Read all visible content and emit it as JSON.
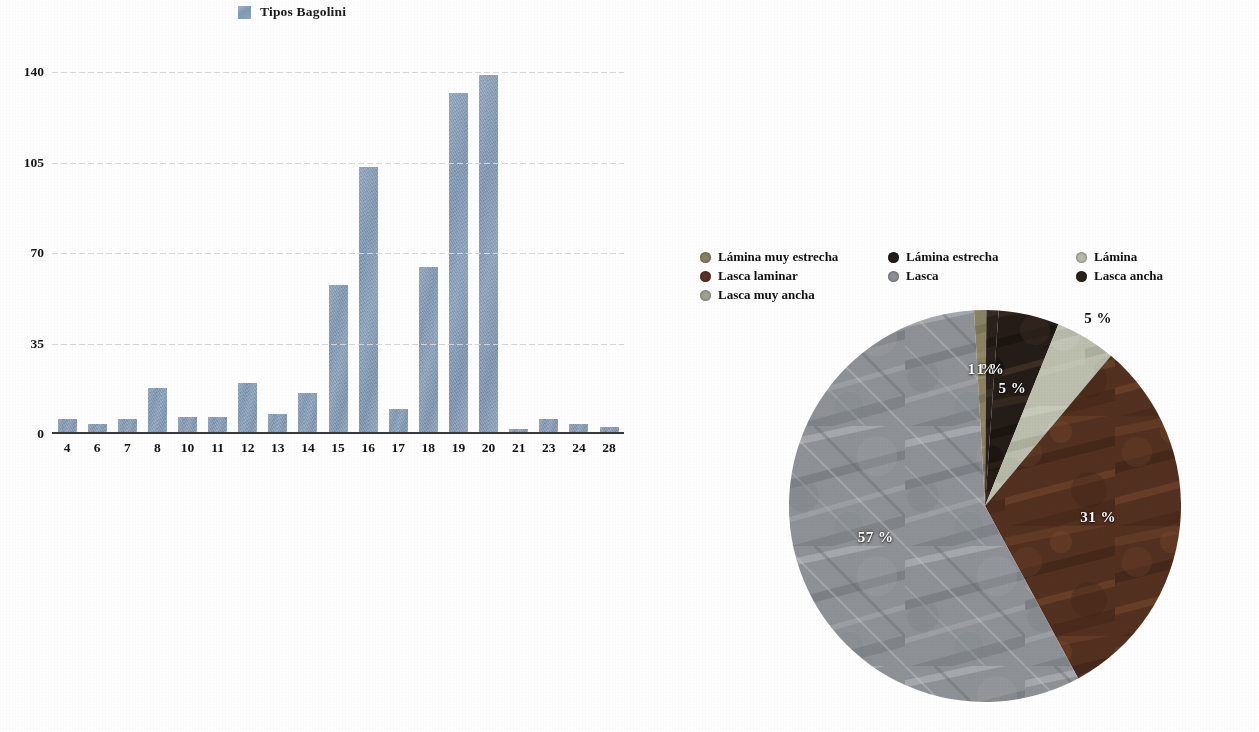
{
  "bar_legend": {
    "label": "Tipos Bagolini",
    "swatch_color": "#7f9ab5"
  },
  "pie_legend": {
    "items": [
      {
        "label": "Lámina muy estrecha",
        "color": "#8a8260"
      },
      {
        "label": "Lámina estrecha",
        "color": "#241d19"
      },
      {
        "label": "Lámina",
        "color": "#b9bcab"
      },
      {
        "label": "Lasca laminar",
        "color": "#5a3224"
      },
      {
        "label": "Lasca",
        "color": "#8e9296"
      },
      {
        "label": "Lasca ancha",
        "color": "#2a211c"
      },
      {
        "label": "Lasca muy ancha",
        "color": "#a3a48f"
      }
    ]
  },
  "chart_data": [
    {
      "type": "bar",
      "title": "Tipos Bagolini",
      "xlabel": "",
      "ylabel": "",
      "categories": [
        "4",
        "6",
        "7",
        "8",
        "10",
        "11",
        "12",
        "13",
        "14",
        "15",
        "16",
        "17",
        "18",
        "19",
        "20",
        "21",
        "23",
        "24",
        "28"
      ],
      "values": [
        5,
        3,
        5,
        17,
        6,
        6,
        19,
        7,
        15,
        57,
        103,
        9,
        64,
        132,
        139,
        1,
        5,
        3,
        2
      ],
      "series": [
        {
          "name": "Tipos Bagolini",
          "values": [
            5,
            3,
            5,
            17,
            6,
            6,
            19,
            7,
            15,
            57,
            103,
            9,
            64,
            132,
            139,
            1,
            5,
            3,
            2
          ]
        }
      ],
      "ylim": [
        0,
        140
      ],
      "yticks": [
        "0",
        "35",
        "70",
        "105",
        "140"
      ],
      "ytick_values": [
        0,
        35,
        70,
        105,
        140
      ],
      "grid": true,
      "legend_position": "top-center",
      "color": "#7f9ab5"
    },
    {
      "type": "pie",
      "title": "",
      "categories": [
        "Lámina muy estrecha",
        "Lámina estrecha",
        "Lámina",
        "Lasca laminar",
        "Lasca",
        "Lasca ancha",
        "Lasca muy ancha"
      ],
      "values": [
        1,
        5,
        5,
        31,
        57,
        1,
        0
      ],
      "labels": [
        "1 %",
        "5 %",
        "5 %",
        "31 %",
        "57 %",
        "1 %",
        ""
      ],
      "colors": [
        "#8a8260",
        "#241d19",
        "#b9bcab",
        "#5a3224",
        "#8e9296",
        "#2a211c",
        "#a3a48f"
      ],
      "legend_position": "top",
      "slice_labels_shown": [
        "5 %",
        "1 %",
        "1 %",
        "5 %",
        "31 %",
        "57 %"
      ]
    }
  ]
}
